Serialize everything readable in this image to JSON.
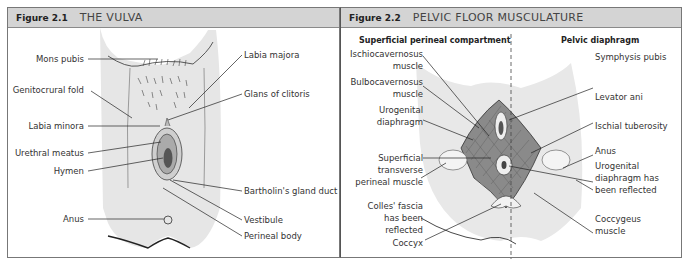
{
  "figures": [
    {
      "number": "Figure 2.1",
      "title": "THE VULVA",
      "labels_left": [
        "Mons pubis",
        "Genitocrural fold",
        "Labia minora",
        "Urethral meatus",
        "Hymen",
        "Anus"
      ],
      "labels_right": [
        "Labia majora",
        "Glans of clitoris",
        "Bartholin's gland duct",
        "Vestibule",
        "Perineal body"
      ]
    },
    {
      "number": "Figure 2.2",
      "title": "PELVIC FLOOR MUSCULATURE",
      "subtitle_left": "Superficial perineal compartment",
      "subtitle_right": "Pelvic diaphragm",
      "labels_left": [
        [
          "Ischiocavernosus",
          "muscle"
        ],
        [
          "Bulbocavernosus",
          "muscle"
        ],
        [
          "Urogenital",
          "diaphragm"
        ],
        [
          "Superficial",
          "transverse",
          "perineal muscle"
        ],
        [
          "Colles' fascia",
          "has been",
          "reflected"
        ],
        [
          "Coccyx"
        ]
      ],
      "labels_right": [
        [
          "Symphysis pubis"
        ],
        [
          "Levator ani"
        ],
        [
          "Ischial tuberosity"
        ],
        [
          "Anus"
        ],
        [
          "Urogenital",
          "diaphragm has",
          "been reflected"
        ],
        [
          "Coccygeus",
          "muscle"
        ]
      ]
    }
  ],
  "colors": {
    "header_bg": "#d4d4d4",
    "skin": "#e6e6e6",
    "muscle": "#8a8a8a",
    "border": "#777777"
  }
}
